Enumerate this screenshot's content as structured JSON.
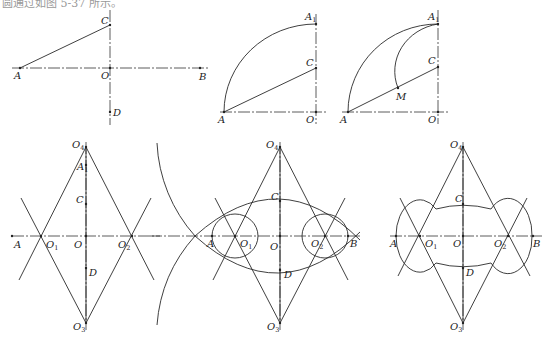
{
  "caption": "圆通过如图 5-37 所示。",
  "figures": [
    {
      "id": "step1",
      "axes": [
        {
          "x1": 12,
          "y1": 68,
          "x2": 210,
          "y2": 68
        },
        {
          "x1": 110,
          "y1": 10,
          "x2": 110,
          "y2": 125
        }
      ],
      "lines": [
        {
          "x1": 20,
          "y1": 68,
          "x2": 110,
          "y2": 25
        }
      ],
      "arcs": [],
      "ellipses": [],
      "points": [
        {
          "x": 20,
          "y": 68,
          "label": "A",
          "lx": 14,
          "ly": 79
        },
        {
          "x": 110,
          "y": 25,
          "label": "C",
          "lx": 101,
          "ly": 24
        },
        {
          "x": 110,
          "y": 68,
          "label": "O",
          "lx": 101,
          "ly": 79
        },
        {
          "x": 200,
          "y": 68,
          "label": "B",
          "lx": 199,
          "ly": 80
        },
        {
          "x": 110,
          "y": 112,
          "label": "D",
          "lx": 113,
          "ly": 116
        }
      ]
    },
    {
      "id": "step2",
      "axes": [
        {
          "x1": 220,
          "y1": 112,
          "x2": 327,
          "y2": 112
        },
        {
          "x1": 316,
          "y1": 14,
          "x2": 316,
          "y2": 124
        }
      ],
      "lines": [
        {
          "x1": 224,
          "y1": 112,
          "x2": 316,
          "y2": 68
        }
      ],
      "arcs": [
        {
          "d": "M224,112 A92,88 0 0 1 316,24"
        }
      ],
      "ellipses": [],
      "points": [
        {
          "x": 224,
          "y": 112,
          "label": "A",
          "lx": 218,
          "ly": 123
        },
        {
          "x": 316,
          "y": 24,
          "label": "A",
          "sub": "1",
          "lx": 305,
          "ly": 20
        },
        {
          "x": 316,
          "y": 68,
          "label": "C",
          "lx": 306,
          "ly": 66
        },
        {
          "x": 316,
          "y": 112,
          "label": "O",
          "lx": 306,
          "ly": 123
        }
      ]
    },
    {
      "id": "step3",
      "axes": [
        {
          "x1": 342,
          "y1": 112,
          "x2": 450,
          "y2": 112
        },
        {
          "x1": 438,
          "y1": 10,
          "x2": 438,
          "y2": 124
        }
      ],
      "lines": [
        {
          "x1": 348,
          "y1": 112,
          "x2": 438,
          "y2": 67
        }
      ],
      "arcs": [
        {
          "d": "M348,112 A90,88 0 0 1 438,24"
        },
        {
          "d": "M438,24 A52,48 0 0 0 398,88"
        }
      ],
      "ellipses": [],
      "points": [
        {
          "x": 348,
          "y": 112,
          "label": "A",
          "lx": 340,
          "ly": 123
        },
        {
          "x": 438,
          "y": 24,
          "label": "A",
          "sub": "1",
          "lx": 428,
          "ly": 20
        },
        {
          "x": 438,
          "y": 67,
          "label": "C",
          "lx": 428,
          "ly": 64
        },
        {
          "x": 398,
          "y": 88,
          "label": "M",
          "lx": 396,
          "ly": 100
        },
        {
          "x": 438,
          "y": 112,
          "label": "O",
          "lx": 428,
          "ly": 123
        }
      ]
    },
    {
      "id": "step4",
      "axes": [
        {
          "x1": 12,
          "y1": 236,
          "x2": 160,
          "y2": 236
        },
        {
          "x1": 86,
          "y1": 142,
          "x2": 86,
          "y2": 330
        }
      ],
      "lines": [
        {
          "x1": 86,
          "y1": 147,
          "x2": 19,
          "y2": 280
        },
        {
          "x1": 86,
          "y1": 147,
          "x2": 154,
          "y2": 280
        },
        {
          "x1": 86,
          "y1": 323,
          "x2": 21,
          "y2": 198
        },
        {
          "x1": 86,
          "y1": 323,
          "x2": 151,
          "y2": 198
        },
        {
          "x1": 86,
          "y1": 147,
          "x2": 86,
          "y2": 323
        }
      ],
      "arcs": [],
      "ellipses": [],
      "points": [
        {
          "x": 86,
          "y": 147,
          "label": "O",
          "sub": "4",
          "lx": 72,
          "ly": 148
        },
        {
          "x": 86,
          "y": 165,
          "label": "A",
          "sub": "1",
          "lx": 77,
          "ly": 170
        },
        {
          "x": 86,
          "y": 204,
          "label": "C",
          "lx": 76,
          "ly": 203
        },
        {
          "x": 41,
          "y": 236,
          "label": "O",
          "sub": "1",
          "lx": 46,
          "ly": 248
        },
        {
          "x": 86,
          "y": 236,
          "label": "O",
          "lx": 74,
          "ly": 248
        },
        {
          "x": 132,
          "y": 236,
          "label": "O",
          "sub": "2",
          "lx": 118,
          "ly": 248
        },
        {
          "x": 12,
          "y": 236,
          "label": "A",
          "lx": 14,
          "ly": 248
        },
        {
          "x": 86,
          "y": 268,
          "label": "D",
          "lx": 89,
          "ly": 276
        },
        {
          "x": 86,
          "y": 323,
          "label": "O",
          "sub": "3",
          "lx": 73,
          "ly": 330
        }
      ]
    },
    {
      "id": "step5",
      "axes": [
        {
          "x1": 150,
          "y1": 236,
          "x2": 360,
          "y2": 236
        },
        {
          "x1": 280,
          "y1": 142,
          "x2": 280,
          "y2": 330
        }
      ],
      "lines": [
        {
          "x1": 280,
          "y1": 147,
          "x2": 213,
          "y2": 280
        },
        {
          "x1": 280,
          "y1": 147,
          "x2": 348,
          "y2": 280
        },
        {
          "x1": 280,
          "y1": 323,
          "x2": 215,
          "y2": 198
        },
        {
          "x1": 280,
          "y1": 323,
          "x2": 345,
          "y2": 198
        },
        {
          "x1": 280,
          "y1": 147,
          "x2": 280,
          "y2": 323
        }
      ],
      "arcs": [
        {
          "d": "M157,143 A150,150 0 0 0 195,236"
        },
        {
          "d": "M195,236 A150,150 0 0 0 157,325"
        },
        {
          "d": "M195,236 Q280,160 360,240"
        },
        {
          "d": "M195,236 Q280,312 360,232"
        }
      ],
      "ellipses": [
        {
          "cx": 235,
          "cy": 236,
          "rx": 23,
          "ry": 22
        },
        {
          "cx": 325,
          "cy": 236,
          "rx": 23,
          "ry": 22
        }
      ],
      "points": [
        {
          "x": 280,
          "y": 147,
          "label": "O",
          "sub": "4",
          "lx": 266,
          "ly": 148
        },
        {
          "x": 280,
          "y": 201,
          "label": "C",
          "lx": 271,
          "ly": 200
        },
        {
          "x": 212,
          "y": 236,
          "label": "A",
          "lx": 207,
          "ly": 247
        },
        {
          "x": 235,
          "y": 236,
          "label": "O",
          "sub": "1",
          "lx": 240,
          "ly": 247
        },
        {
          "x": 280,
          "y": 236,
          "label": "O",
          "lx": 270,
          "ly": 250
        },
        {
          "x": 325,
          "y": 236,
          "label": "O",
          "sub": "2",
          "lx": 311,
          "ly": 247
        },
        {
          "x": 348,
          "y": 236,
          "label": "B",
          "lx": 350,
          "ly": 247
        },
        {
          "x": 280,
          "y": 270,
          "label": "D",
          "lx": 284,
          "ly": 278
        },
        {
          "x": 280,
          "y": 323,
          "label": "O",
          "sub": "3",
          "lx": 267,
          "ly": 330
        }
      ]
    },
    {
      "id": "step6",
      "axes": [
        {
          "x1": 390,
          "y1": 236,
          "x2": 542,
          "y2": 236
        },
        {
          "x1": 463,
          "y1": 142,
          "x2": 463,
          "y2": 330
        }
      ],
      "lines": [
        {
          "x1": 463,
          "y1": 147,
          "x2": 398,
          "y2": 276
        },
        {
          "x1": 463,
          "y1": 147,
          "x2": 530,
          "y2": 276
        },
        {
          "x1": 463,
          "y1": 323,
          "x2": 400,
          "y2": 198
        },
        {
          "x1": 463,
          "y1": 323,
          "x2": 527,
          "y2": 198
        },
        {
          "x1": 463,
          "y1": 147,
          "x2": 463,
          "y2": 323
        }
      ],
      "arcs": [
        {
          "d": "M420,236 m-24,0 A24,36 0 0 1 436,209 A105,105 0 0 1 491,209 A24,36 0 0 1 532,236 A24,36 0 0 1 491,263 A105,105 0 0 1 436,263 A24,36 0 0 1 396,236 Z"
        }
      ],
      "ellipses": [],
      "points": [
        {
          "x": 463,
          "y": 147,
          "label": "O",
          "sub": "4",
          "lx": 450,
          "ly": 148
        },
        {
          "x": 463,
          "y": 204,
          "label": "C",
          "lx": 455,
          "ly": 202
        },
        {
          "x": 396,
          "y": 236,
          "label": "A",
          "lx": 390,
          "ly": 247
        },
        {
          "x": 420,
          "y": 236,
          "label": "O",
          "sub": "1",
          "lx": 425,
          "ly": 247
        },
        {
          "x": 463,
          "y": 236,
          "label": "O",
          "lx": 453,
          "ly": 247
        },
        {
          "x": 508,
          "y": 236,
          "label": "O",
          "sub": "2",
          "lx": 494,
          "ly": 247
        },
        {
          "x": 533,
          "y": 236,
          "label": "B",
          "lx": 533,
          "ly": 247
        },
        {
          "x": 463,
          "y": 268,
          "label": "D",
          "lx": 466,
          "ly": 276
        },
        {
          "x": 463,
          "y": 323,
          "label": "O",
          "sub": "3",
          "lx": 450,
          "ly": 330
        }
      ]
    }
  ]
}
